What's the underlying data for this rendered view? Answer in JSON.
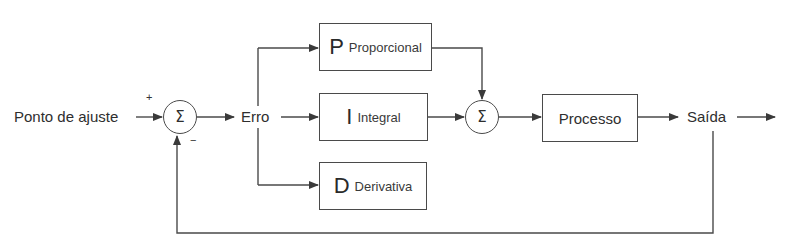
{
  "diagram": {
    "type": "PID control block diagram",
    "colors": {
      "line": "#4a4a4a",
      "text": "#2e2e2e",
      "background": "#ffffff"
    },
    "input_label": "Ponto de ajuste",
    "error_label": "Erro",
    "output_label": "Saída",
    "summing_junction_1": {
      "symbol": "Σ",
      "plus_sign": "+",
      "minus_sign": "−"
    },
    "summing_junction_2": {
      "symbol": "Σ"
    },
    "blocks": {
      "proportional": {
        "letter": "P",
        "label": "Proporcional"
      },
      "integral": {
        "letter": "I",
        "label": "Integral"
      },
      "derivative": {
        "letter": "D",
        "label": "Derivativa"
      },
      "process": {
        "label": "Processo"
      }
    }
  }
}
